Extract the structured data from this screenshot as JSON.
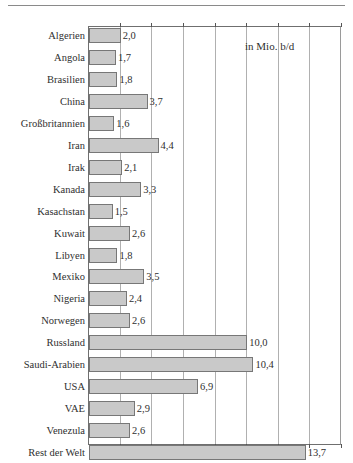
{
  "chart_data": {
    "type": "bar",
    "orientation": "horizontal",
    "title": "",
    "subtitle": "",
    "annotation": "in Mio. b/d",
    "xlabel": "",
    "ylabel": "",
    "xlim": [
      0,
      16
    ],
    "grid": true,
    "gridlines": [
      2,
      4,
      6,
      8,
      10,
      12,
      14,
      16
    ],
    "legend": "none",
    "decimal_separator": ",",
    "bar_fill": "#c9c9c9",
    "bar_border": "#777777",
    "categories": [
      "Algerien",
      "Angola",
      "Brasilien",
      "China",
      "Großbritannien",
      "Iran",
      "Irak",
      "Kanada",
      "Kasachstan",
      "Kuwait",
      "Libyen",
      "Mexiko",
      "Nigeria",
      "Norwegen",
      "Russland",
      "Saudi-Arabien",
      "USA",
      "VAE",
      "Venezula",
      "Rest der Welt"
    ],
    "values": [
      2.0,
      1.7,
      1.8,
      3.7,
      1.6,
      4.4,
      2.1,
      3.3,
      1.5,
      2.6,
      1.8,
      3.5,
      2.4,
      2.6,
      10.0,
      10.4,
      6.9,
      2.9,
      2.6,
      13.7
    ],
    "value_labels": [
      "2,0",
      "1,7",
      "1,8",
      "3,7",
      "1,6",
      "4,4",
      "2,1",
      "3,3",
      "1,5",
      "2,6",
      "1,8",
      "3,5",
      "2,4",
      "2,6",
      "10,0",
      "10,4",
      "6,9",
      "2,9",
      "2,6",
      "13,7"
    ]
  }
}
